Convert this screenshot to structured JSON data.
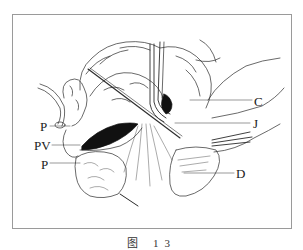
{
  "figure": {
    "type": "surgical line illustration",
    "frame_color": "#9a9a9a",
    "ink_color": "#1a1a1a",
    "labels": [
      {
        "id": "P_upper",
        "text": "P",
        "x": 40,
        "y": 120
      },
      {
        "id": "PV",
        "text": "PV",
        "x": 36,
        "y": 139
      },
      {
        "id": "P_lower",
        "text": "P",
        "x": 41,
        "y": 158
      },
      {
        "id": "C",
        "text": "C",
        "x": 254,
        "y": 95
      },
      {
        "id": "J",
        "text": "J",
        "x": 253,
        "y": 118
      },
      {
        "id": "D",
        "text": "D",
        "x": 236,
        "y": 167
      }
    ],
    "caption": "图 13"
  }
}
